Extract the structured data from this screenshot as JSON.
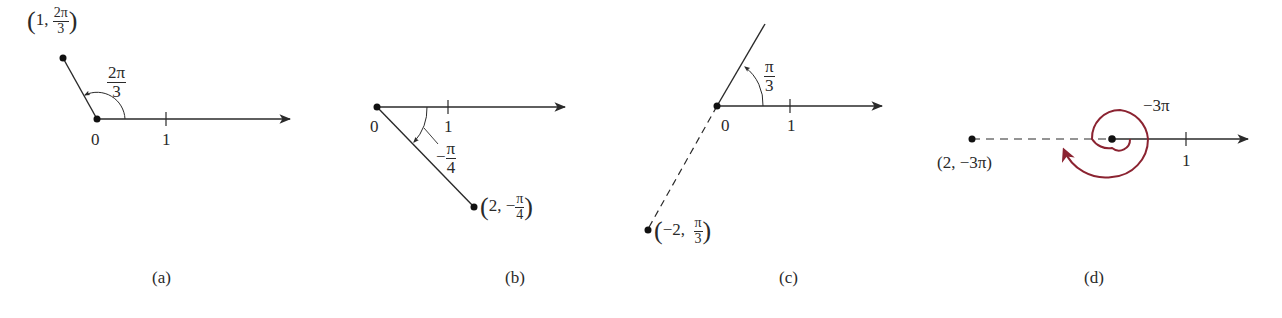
{
  "colors": {
    "ink": "#2a2a2a",
    "spiral": "#8b2331",
    "background": "#ffffff"
  },
  "panels": [
    {
      "id": "a",
      "caption": "(a)",
      "origin_label": "0",
      "tick_label": "1",
      "angle_label": {
        "num": "2π",
        "den": "3"
      },
      "point_label": {
        "r": "1",
        "theta_num": "2π",
        "theta_den": "3"
      },
      "point_text": "(1, 2π/3)"
    },
    {
      "id": "b",
      "caption": "(b)",
      "origin_label": "0",
      "tick_label": "1",
      "angle_label": {
        "sign": "−",
        "num": "π",
        "den": "4"
      },
      "point_label": {
        "r": "2",
        "sign": "−",
        "theta_num": "π",
        "theta_den": "4"
      },
      "point_text": "(2, −π/4)"
    },
    {
      "id": "c",
      "caption": "(c)",
      "origin_label": "0",
      "tick_label": "1",
      "angle_label": {
        "num": "π",
        "den": "3"
      },
      "point_label": {
        "r": "−2",
        "theta_num": "π",
        "theta_den": "3"
      },
      "point_text": "(−2, π/3)"
    },
    {
      "id": "d",
      "caption": "(d)",
      "tick_label": "1",
      "angle_label": "−3π",
      "point_label": "(2, −3π)"
    }
  ]
}
